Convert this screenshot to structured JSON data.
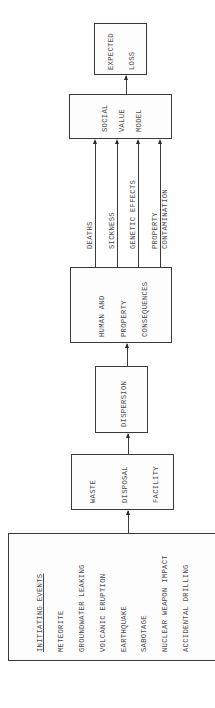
{
  "diagram": {
    "orientation": "rotated-90-ccw",
    "colors": {
      "line": "#3a3a3a",
      "text": "#4a4a4a",
      "background": "#ffffff"
    },
    "nodes": {
      "expected_loss": {
        "lines": [
          "EXPECTED",
          "LOSS"
        ]
      },
      "social_value_model": {
        "lines": [
          "SOCIAL",
          "VALUE",
          "MODEL"
        ]
      },
      "human_property_consequences": {
        "lines": [
          "HUMAN  AND",
          "PROPERTY",
          "CONSEQUENCES"
        ]
      },
      "dispersion": {
        "lines": [
          "DISPERSION"
        ]
      },
      "waste_disposal_facility": {
        "lines": [
          "WASTE",
          "DISPOSAL",
          "FACILITY"
        ]
      },
      "initiating_events": {
        "title": "INITIATING EVENTS",
        "items": [
          "METEORITE",
          "GROUNDWATER LEAKING",
          "VOLCANIC ERUPTION",
          "EARTHQUAKE",
          "SABOTAGE",
          "NUCLEAR WEAPON IMPACT",
          "ACCIDENTAL DRILLING"
        ]
      }
    },
    "consequence_arrows": [
      {
        "lines": [
          "DEATHS"
        ]
      },
      {
        "lines": [
          "SICKNESS"
        ]
      },
      {
        "lines": [
          "GENETIC EFFECTS"
        ]
      },
      {
        "lines": [
          "PROPERTY",
          "CONTAMINATION"
        ]
      }
    ],
    "edges": [
      {
        "from": "initiating_events",
        "to": "waste_disposal_facility"
      },
      {
        "from": "waste_disposal_facility",
        "to": "dispersion"
      },
      {
        "from": "dispersion",
        "to": "human_property_consequences"
      },
      {
        "from": "human_property_consequences",
        "to": "social_value_model",
        "label": "DEATHS"
      },
      {
        "from": "human_property_consequences",
        "to": "social_value_model",
        "label": "SICKNESS"
      },
      {
        "from": "human_property_consequences",
        "to": "social_value_model",
        "label": "GENETIC EFFECTS"
      },
      {
        "from": "human_property_consequences",
        "to": "social_value_model",
        "label": "PROPERTY CONTAMINATION"
      },
      {
        "from": "social_value_model",
        "to": "expected_loss"
      }
    ]
  }
}
